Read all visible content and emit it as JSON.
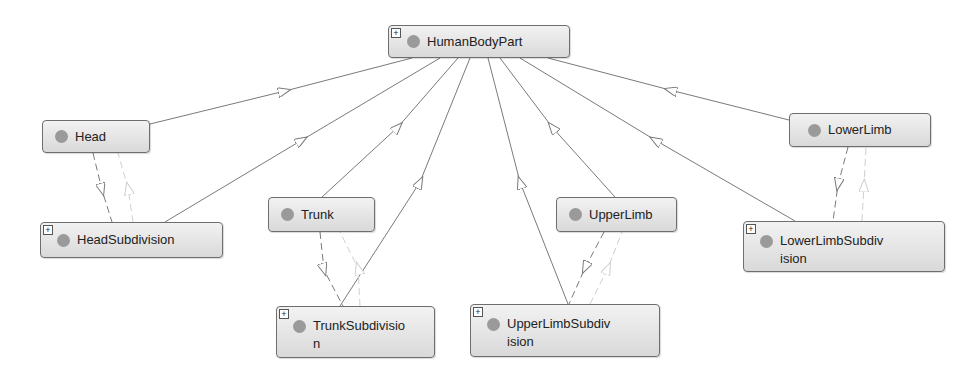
{
  "diagram": {
    "nodes": [
      {
        "id": "HumanBodyPart",
        "label": "HumanBodyPart",
        "expandable": true
      },
      {
        "id": "Head",
        "label": "Head",
        "expandable": false
      },
      {
        "id": "HeadSubdivision",
        "label": "HeadSubdivision",
        "expandable": true
      },
      {
        "id": "Trunk",
        "label": "Trunk",
        "expandable": false
      },
      {
        "id": "TrunkSubdivision",
        "label": "TrunkSubdivisio n",
        "expandable": true
      },
      {
        "id": "UpperLimb",
        "label": "UpperLimb",
        "expandable": false
      },
      {
        "id": "UpperLimbSubdivision",
        "label": "UpperLimbSubdiv ision",
        "expandable": true
      },
      {
        "id": "LowerLimb",
        "label": "LowerLimb",
        "expandable": false
      },
      {
        "id": "LowerLimbSubdivision",
        "label": "LowerLimbSubdiv ision",
        "expandable": true
      }
    ],
    "expand_symbol": "+",
    "edges": [
      {
        "from": "Head",
        "to": "HumanBodyPart",
        "style": "solid"
      },
      {
        "from": "HeadSubdivision",
        "to": "HumanBodyPart",
        "style": "solid"
      },
      {
        "from": "Trunk",
        "to": "HumanBodyPart",
        "style": "solid"
      },
      {
        "from": "TrunkSubdivision",
        "to": "HumanBodyPart",
        "style": "solid"
      },
      {
        "from": "UpperLimb",
        "to": "HumanBodyPart",
        "style": "solid"
      },
      {
        "from": "UpperLimbSubdivision",
        "to": "HumanBodyPart",
        "style": "solid"
      },
      {
        "from": "LowerLimb",
        "to": "HumanBodyPart",
        "style": "solid"
      },
      {
        "from": "LowerLimbSubdivision",
        "to": "HumanBodyPart",
        "style": "solid"
      },
      {
        "from": "Head",
        "to": "HeadSubdivision",
        "style": "dashed"
      },
      {
        "from": "HeadSubdivision",
        "to": "Head",
        "style": "dashed-light"
      },
      {
        "from": "Trunk",
        "to": "TrunkSubdivision",
        "style": "dashed"
      },
      {
        "from": "TrunkSubdivision",
        "to": "Trunk",
        "style": "dashed-light"
      },
      {
        "from": "UpperLimb",
        "to": "UpperLimbSubdivision",
        "style": "dashed"
      },
      {
        "from": "UpperLimbSubdivision",
        "to": "UpperLimb",
        "style": "dashed-light"
      },
      {
        "from": "LowerLimb",
        "to": "LowerLimbSubdivision",
        "style": "dashed"
      },
      {
        "from": "LowerLimbSubdivision",
        "to": "LowerLimb",
        "style": "dashed-light"
      }
    ],
    "colors": {
      "node_fill": "#e6e6e6",
      "node_border": "#6e6e6e",
      "dot": "#9a9a9a",
      "edge": "#7a7a7a",
      "edge_light": "#cfcfcf"
    }
  },
  "labels": {
    "HumanBodyPart": "HumanBodyPart",
    "Head": "Head",
    "HeadSubdivision": "HeadSubdivision",
    "Trunk": "Trunk",
    "TrunkSubdivision_1": "TrunkSubdivisio",
    "TrunkSubdivision_2": "n",
    "UpperLimb": "UpperLimb",
    "UpperLimbSubdivision_1": "UpperLimbSubdiv",
    "UpperLimbSubdivision_2": "ision",
    "LowerLimb": "LowerLimb",
    "LowerLimbSubdivision_1": "LowerLimbSubdiv",
    "LowerLimbSubdivision_2": "ision",
    "plus": "+"
  }
}
